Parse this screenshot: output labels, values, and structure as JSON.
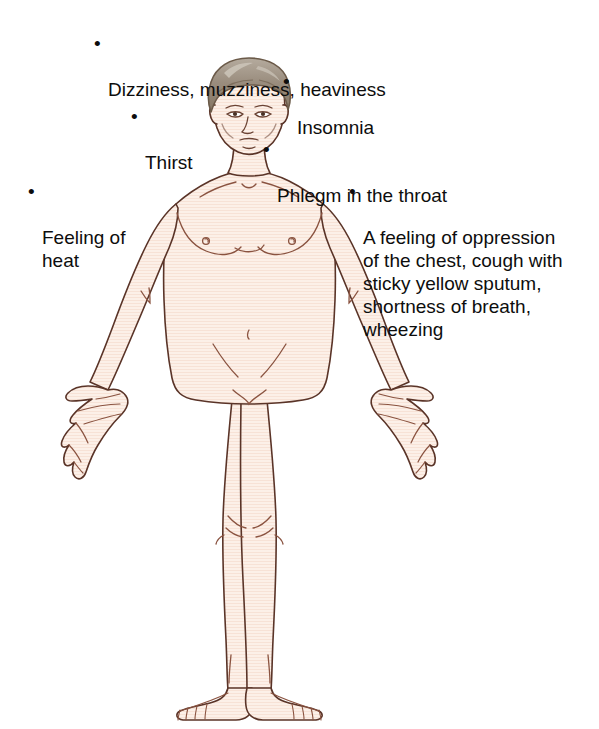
{
  "figure": {
    "colors": {
      "skin_fill": "#fbeee5",
      "skin_shade": "#f6e0d2",
      "outline": "#5a3428",
      "outline_light": "#9c6a52",
      "hair_fill": "#9a8d7e",
      "hair_highlight": "#c9c2b6",
      "hair_outline": "#6b5a49",
      "background": "#ffffff",
      "text": "#0d0d0d"
    }
  },
  "annotations": [
    {
      "id": "dizziness",
      "bullet": "•",
      "text": "Dizziness, muzziness, heaviness",
      "region": "head"
    },
    {
      "id": "insomnia",
      "bullet": "•",
      "text": "Insomnia",
      "region": "head"
    },
    {
      "id": "thirst",
      "bullet": "•",
      "text": "Thirst",
      "region": "mouth"
    },
    {
      "id": "phlegm",
      "bullet": "•",
      "text": "Phlegm in the throat",
      "region": "throat"
    },
    {
      "id": "heat",
      "bullet": "•",
      "text": "Feeling of\nheat",
      "region": "whole body"
    },
    {
      "id": "chest",
      "bullet": "•",
      "text": "A feeling of oppression\nof the chest, cough with\nsticky yellow sputum,\nshortness of breath,\nwheezing",
      "region": "chest"
    }
  ]
}
